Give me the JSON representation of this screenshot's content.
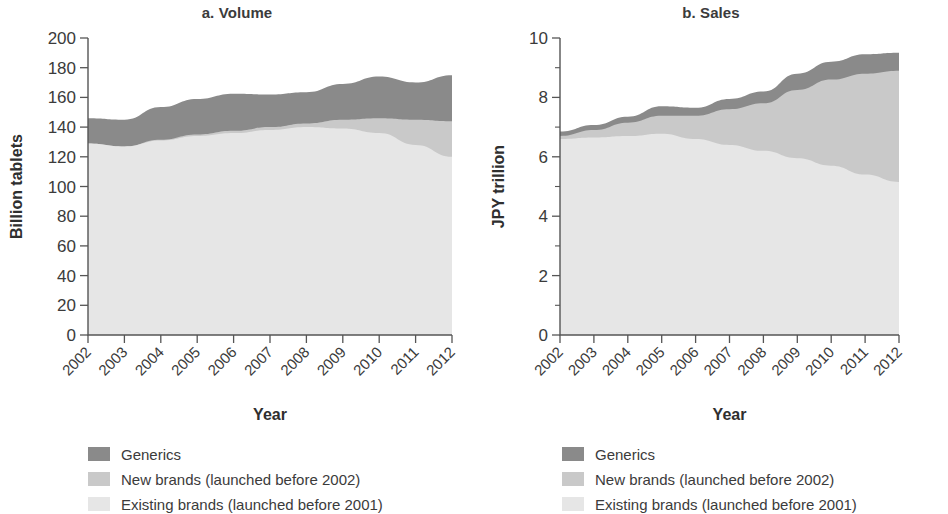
{
  "colors": {
    "generics": "#8a8a8a",
    "new_brands": "#c9c9c9",
    "existing_brands": "#e6e6e6",
    "axis": "#555555",
    "text": "#3b3b3b"
  },
  "legend": {
    "items": [
      {
        "label": "Generics",
        "color_key": "generics"
      },
      {
        "label": "New brands (launched before 2002)",
        "color_key": "new_brands"
      },
      {
        "label": "Existing brands (launched before 2001)",
        "color_key": "existing_brands"
      }
    ]
  },
  "chart_data": [
    {
      "type": "area",
      "id": "volume",
      "title": "a. Volume",
      "xlabel": "Year",
      "ylabel": "Billion tablets",
      "x": [
        2002,
        2003,
        2004,
        2005,
        2006,
        2007,
        2008,
        2009,
        2010,
        2011,
        2012
      ],
      "categories": [
        "2002",
        "2003",
        "2004",
        "2005",
        "2006",
        "2007",
        "2008",
        "2009",
        "2010",
        "2011",
        "2012"
      ],
      "stacked": true,
      "grid": false,
      "legend_position": "below",
      "xlim": [
        2002,
        2012
      ],
      "ylim": [
        0,
        200
      ],
      "yticks": [
        0,
        20,
        40,
        60,
        80,
        100,
        120,
        140,
        160,
        180,
        200
      ],
      "ytick_labels": [
        "0",
        "20",
        "40",
        "60",
        "80",
        "100",
        "120",
        "140",
        "160",
        "180",
        "200"
      ],
      "series": [
        {
          "name": "Existing brands (launched before 2001)",
          "color_key": "existing_brands",
          "values": [
            129,
            127,
            131,
            134,
            136,
            138,
            140,
            139,
            136,
            128,
            120
          ]
        },
        {
          "name": "New brands (launched before 2002)",
          "color_key": "new_brands",
          "values": [
            0,
            0,
            0.5,
            1,
            1.5,
            2,
            2.5,
            6,
            10,
            17,
            24
          ]
        },
        {
          "name": "Generics",
          "color_key": "generics",
          "values": [
            17,
            18,
            22,
            24,
            25,
            22,
            21,
            24,
            28,
            25,
            31
          ]
        }
      ],
      "totals": [
        146,
        145,
        153.5,
        159,
        162.5,
        162,
        163.5,
        169,
        174,
        170,
        175
      ]
    },
    {
      "type": "area",
      "id": "sales",
      "title": "b. Sales",
      "xlabel": "Year",
      "ylabel": "JPY trillion",
      "x": [
        2002,
        2003,
        2004,
        2005,
        2006,
        2007,
        2008,
        2009,
        2010,
        2011,
        2012
      ],
      "categories": [
        "2002",
        "2003",
        "2004",
        "2005",
        "2006",
        "2007",
        "2008",
        "2009",
        "2010",
        "2011",
        "2012"
      ],
      "stacked": true,
      "grid": false,
      "legend_position": "below",
      "xlim": [
        2002,
        2012
      ],
      "ylim": [
        0,
        10
      ],
      "yticks": [
        0,
        1,
        2,
        3,
        4,
        5,
        6,
        7,
        8,
        9,
        10
      ],
      "ytick_labels": [
        "0",
        "",
        "2",
        "",
        "4",
        "",
        "6",
        "",
        "8",
        "",
        "10"
      ],
      "series": [
        {
          "name": "Existing brands (launched before 2001)",
          "color_key": "existing_brands",
          "values": [
            6.6,
            6.65,
            6.7,
            6.78,
            6.6,
            6.4,
            6.2,
            5.95,
            5.7,
            5.4,
            5.15
          ]
        },
        {
          "name": "New brands (launched before 2002)",
          "color_key": "new_brands",
          "values": [
            0.1,
            0.25,
            0.45,
            0.6,
            0.78,
            1.2,
            1.6,
            2.3,
            2.9,
            3.4,
            3.75
          ]
        },
        {
          "name": "Generics",
          "color_key": "generics",
          "values": [
            0.15,
            0.17,
            0.2,
            0.32,
            0.27,
            0.35,
            0.4,
            0.55,
            0.6,
            0.65,
            0.6
          ]
        }
      ],
      "totals": [
        6.85,
        7.07,
        7.35,
        7.7,
        7.65,
        7.95,
        8.2,
        8.8,
        9.2,
        9.45,
        9.5
      ]
    }
  ]
}
